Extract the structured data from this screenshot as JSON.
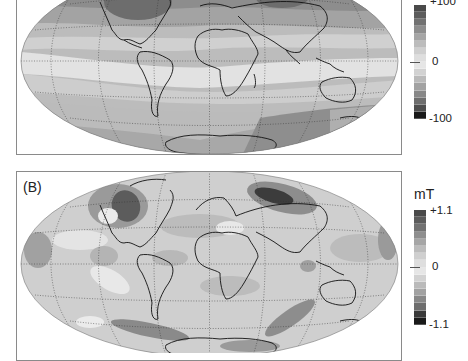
{
  "figure": {
    "panels": [
      {
        "id": "A",
        "label": "",
        "unit": "",
        "colorbar": {
          "max_label": "+100",
          "mid_label": "0",
          "min_label": "-100",
          "levels": [
            "#4a4a4a",
            "#5c5c5c",
            "#727272",
            "#8e8e8e",
            "#a6a6a6",
            "#bcbcbc",
            "#cfcfcf",
            "#dedede",
            "#e6e6e6",
            "#d2d2d2",
            "#bababa",
            "#a2a2a2",
            "#888888",
            "#6e6e6e",
            "#4e4e4e",
            "#1a1a1a"
          ]
        }
      },
      {
        "id": "B",
        "label": "(B)",
        "unit": "mT",
        "colorbar": {
          "max_label": "+1.1",
          "mid_label": "0",
          "min_label": "-1.1",
          "levels": [
            "#4a4a4a",
            "#5c5c5c",
            "#727272",
            "#8e8e8e",
            "#a6a6a6",
            "#bcbcbc",
            "#cfcfcf",
            "#dedede",
            "#e6e6e6",
            "#d2d2d2",
            "#bababa",
            "#a2a2a2",
            "#888888",
            "#6e6e6e",
            "#3a3a3a",
            "#1a1a1a"
          ]
        }
      }
    ]
  },
  "chart_data": [
    {
      "type": "heatmap",
      "title": "",
      "projection": "Hammer (equal-area global map)",
      "colorbar_range": [
        -100,
        100
      ],
      "colorbar_ticks": [
        "+100",
        "0",
        "-100"
      ],
      "description": "Global anomaly map, darker shading at high northern latitudes (N. America, Siberia) and southern high latitudes; light equatorial band near zero"
    },
    {
      "type": "heatmap",
      "title": "(B)",
      "projection": "Hammer (equal-area global map)",
      "unit": "mT",
      "colorbar_range": [
        -1.1,
        1.1
      ],
      "colorbar_ticks": [
        "+1.1",
        "0",
        "-1.1"
      ],
      "description": "Global field map with strong dark patches over N. America and Siberia, smaller-scale patchy structure elsewhere"
    }
  ]
}
